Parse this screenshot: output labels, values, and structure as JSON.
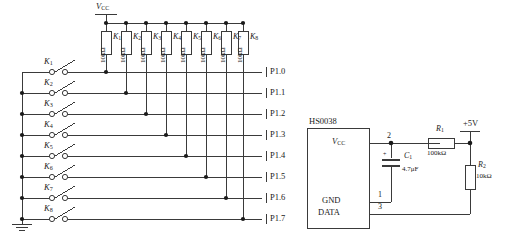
{
  "diagram": {
    "line_color": "#3a3a3a",
    "text_color": "#1a1a1a"
  },
  "supply": {
    "vcc_label": "V",
    "vcc_sub": "CC",
    "plus5v_label": "+5V"
  },
  "switches": [
    {
      "label": "K",
      "sub": "1"
    },
    {
      "label": "K",
      "sub": "2"
    },
    {
      "label": "K",
      "sub": "3"
    },
    {
      "label": "K",
      "sub": "4"
    },
    {
      "label": "K",
      "sub": "5"
    },
    {
      "label": "K",
      "sub": "6"
    },
    {
      "label": "K",
      "sub": "7"
    },
    {
      "label": "K",
      "sub": "8"
    }
  ],
  "pullups": [
    {
      "name": "K",
      "sub": "1",
      "value": "10kΩ"
    },
    {
      "name": "K",
      "sub": "2",
      "value": "10kΩ"
    },
    {
      "name": "K",
      "sub": "3",
      "value": "10kΩ"
    },
    {
      "name": "K",
      "sub": "4",
      "value": "10kΩ"
    },
    {
      "name": "K",
      "sub": "5",
      "value": "10kΩ"
    },
    {
      "name": "K",
      "sub": "6",
      "value": "10kΩ"
    },
    {
      "name": "K",
      "sub": "7",
      "value": "10kΩ"
    },
    {
      "name": "K",
      "sub": "8",
      "value": "10kΩ"
    }
  ],
  "ports": [
    {
      "label": "P1.0"
    },
    {
      "label": "P1.1"
    },
    {
      "label": "P1.2"
    },
    {
      "label": "P1.3"
    },
    {
      "label": "P1.4"
    },
    {
      "label": "P1.5"
    },
    {
      "label": "P1.6"
    },
    {
      "label": "P1.7"
    }
  ],
  "ic": {
    "part_number": "HS0038",
    "pins": [
      {
        "name": "V",
        "sub": "CC",
        "number": "2"
      },
      {
        "name": "GND",
        "sub": "",
        "number": "1"
      },
      {
        "name": "DATA",
        "sub": "",
        "number": "3"
      }
    ]
  },
  "components": {
    "capacitor": {
      "name": "C",
      "sub": "1",
      "value": "4.7μF",
      "polarity": "+"
    },
    "resistor_r1": {
      "name": "R",
      "sub": "1",
      "value": "100kΩ"
    },
    "resistor_r2": {
      "name": "R",
      "sub": "2",
      "value": "10kΩ"
    }
  }
}
